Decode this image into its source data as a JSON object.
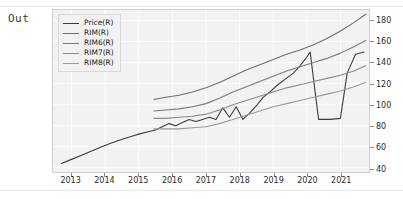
{
  "cell": {
    "prompt_label": "Out"
  },
  "chart_data": {
    "type": "line",
    "title": "",
    "xlabel": "",
    "ylabel": "",
    "grid": true,
    "legend_position": "upper-left-inside",
    "xlim": [
      2012.45,
      2021.85
    ],
    "ylim": [
      36,
      190
    ],
    "xticks": [
      "2013",
      "2014",
      "2015",
      "2016",
      "2017",
      "2018",
      "2019",
      "2020",
      "2021"
    ],
    "xtick_values": [
      2013,
      2014,
      2015,
      2016,
      2017,
      2018,
      2019,
      2020,
      2021
    ],
    "yticks": [
      "40",
      "60",
      "80",
      "100",
      "120",
      "140",
      "160",
      "180"
    ],
    "ytick_values": [
      40,
      60,
      80,
      100,
      120,
      140,
      160,
      180
    ],
    "series": [
      {
        "name": "Price(R)",
        "color": "#3c3c3c",
        "x": [
          2012.7,
          2013.0,
          2013.3,
          2013.6,
          2013.9,
          2014.15,
          2014.4,
          2014.6,
          2014.8,
          2015.0,
          2015.25,
          2015.5,
          2015.7,
          2015.9,
          2016.1,
          2016.3,
          2016.5,
          2016.7,
          2016.9,
          2017.1,
          2017.3,
          2017.5,
          2017.7,
          2017.9,
          2018.1,
          2018.3,
          2018.5,
          2018.7,
          2018.9,
          2019.1,
          2019.35,
          2019.6,
          2019.8,
          2019.95,
          2020.1,
          2020.35,
          2020.7,
          2021.0,
          2021.2,
          2021.45,
          2021.7
        ],
        "y": [
          44,
          48,
          52,
          56,
          60,
          63,
          66,
          68,
          70,
          72,
          74,
          76,
          79,
          82,
          80,
          83,
          86,
          84,
          86,
          88,
          86,
          97,
          88,
          98,
          86,
          92,
          99,
          107,
          112,
          118,
          124,
          130,
          137,
          143,
          150,
          86,
          86,
          87,
          130,
          148,
          150
        ]
      },
      {
        "name": "RIM(R)",
        "color": "#6e6e6e",
        "x": [
          2015.45,
          2015.8,
          2016.2,
          2016.6,
          2017.0,
          2017.4,
          2017.8,
          2018.2,
          2018.6,
          2019.0,
          2019.4,
          2019.8,
          2020.2,
          2020.6,
          2021.0,
          2021.4,
          2021.75
        ],
        "y": [
          105,
          107,
          109,
          112,
          116,
          121,
          127,
          133,
          138,
          143,
          148,
          152,
          157,
          163,
          170,
          178,
          186
        ]
      },
      {
        "name": "RIM6(R)",
        "color": "#7a7a7a",
        "x": [
          2015.45,
          2015.8,
          2016.2,
          2016.6,
          2017.0,
          2017.4,
          2017.8,
          2018.2,
          2018.6,
          2019.0,
          2019.4,
          2019.8,
          2020.2,
          2020.6,
          2021.0,
          2021.4,
          2021.75
        ],
        "y": [
          94,
          95,
          96,
          98,
          101,
          106,
          112,
          117,
          122,
          127,
          132,
          136,
          140,
          144,
          149,
          155,
          161
        ]
      },
      {
        "name": "RIM7(R)",
        "color": "#8a8a8a",
        "x": [
          2015.45,
          2015.8,
          2016.2,
          2016.6,
          2017.0,
          2017.4,
          2017.8,
          2018.2,
          2018.6,
          2019.0,
          2019.4,
          2019.8,
          2020.2,
          2020.6,
          2021.0,
          2021.4,
          2021.75
        ],
        "y": [
          87,
          87,
          88,
          89,
          91,
          95,
          100,
          104,
          108,
          112,
          116,
          119,
          122,
          125,
          128,
          132,
          137
        ]
      },
      {
        "name": "RIM8(R)",
        "color": "#9a9a9a",
        "x": [
          2015.45,
          2015.8,
          2016.2,
          2016.6,
          2017.0,
          2017.4,
          2017.8,
          2018.2,
          2018.6,
          2019.0,
          2019.4,
          2019.8,
          2020.2,
          2020.6,
          2021.0,
          2021.4,
          2021.75
        ],
        "y": [
          77,
          77,
          77,
          78,
          79,
          82,
          86,
          90,
          94,
          98,
          101,
          104,
          107,
          110,
          113,
          117,
          121
        ]
      }
    ]
  }
}
